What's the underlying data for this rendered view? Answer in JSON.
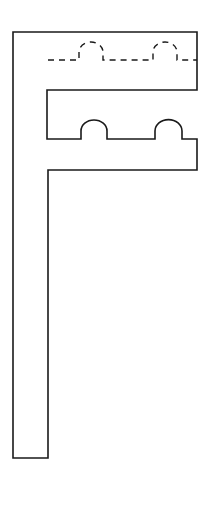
{
  "diagram": {
    "title": "",
    "colors": {
      "background": "#ffffff",
      "stroke": "#1a1a1a"
    },
    "outline": {
      "name": "f-shaped-piece-outline",
      "path": "M13 32 L197 32 L197 90 L47 90 L47 139 L81 139 L81 131 A13 11 0 0 1 107 131 L107 139 L155 139 L155 131 A13 11 0 0 1 182 131 L182 139 L197 139 L197 170 L48 170 L48 458 L13 458 Z"
    },
    "fold_line": {
      "name": "dashed-fold-line",
      "path": "M48 60 L79 60 L79 52 A12 10 0 0 1 103 52 L103 60 L153 60 L153 52 A12 10 0 0 1 177 52 L177 60 L197 60",
      "dash": "6 5"
    }
  }
}
